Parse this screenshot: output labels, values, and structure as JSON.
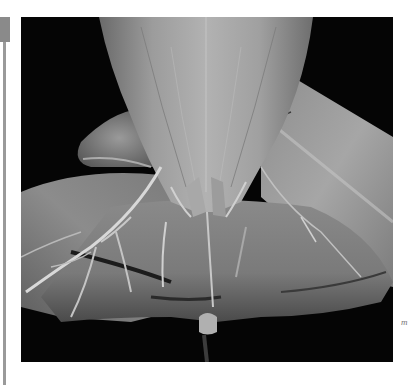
{
  "page": {
    "side_marker": {
      "color": "#8a8a8a"
    },
    "figure": {
      "description": "Grayscale photograph of an anatomical dissection specimen",
      "background_color": "#050505",
      "tone": "grayscale"
    },
    "annotation_label": "m"
  }
}
